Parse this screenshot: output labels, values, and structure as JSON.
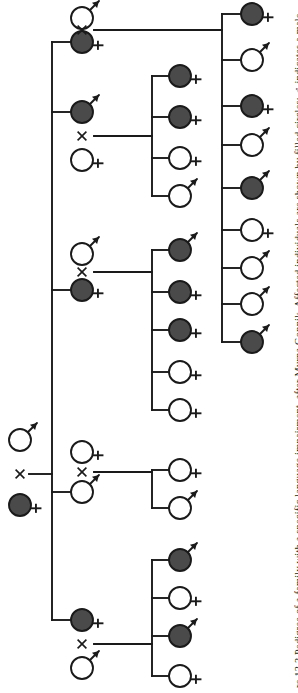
{
  "figure": {
    "caption": "re 13.3 Pedigree of a family with a specific language impairment, after Myrna Gopnik. Affected individuals are shown by filled circles; ♂ indicates a male,",
    "caption_number": "13.3",
    "caption_title": "Pedigree of a family with a specific language impairment",
    "caption_attribution": "after Myrna Gopnik",
    "caption_legend": "Affected individuals are shown by filled circles; ♂ indicates a male,"
  },
  "legend": {
    "affected_label": "affected",
    "unaffected_label": "unaffected",
    "male_symbol": "♂",
    "female_symbol": "♀",
    "mating_symbol": "×",
    "affected_fill": "#4a4a4a",
    "unaffected_fill": "#ffffff",
    "stroke": "#1a1a1a"
  },
  "pedigree": {
    "type": "pedigree",
    "orientation": "left-to-right",
    "generations": 3,
    "total_individuals": 35,
    "founders": {
      "label": "Generation I",
      "members": [
        {
          "id": "I-1",
          "sex": "male",
          "affected": false,
          "x": 20,
          "y": 440
        },
        {
          "id": "I-2",
          "sex": "female",
          "affected": true,
          "x": 20,
          "y": 505
        }
      ],
      "mating_x": 20,
      "mating_y": 474
    },
    "generation_ii": {
      "label": "Generation II",
      "sibship_trunk_x": 52,
      "sibship_top_y": 42,
      "sibship_bottom_y": 620,
      "members": [
        {
          "id": "II-1",
          "sex": "female",
          "affected": true,
          "x": 82,
          "y": 42,
          "spouse_id": "II-1s",
          "spouse_sex": "male",
          "spouse_affected": false,
          "spouse_x": 82,
          "spouse_y": 18,
          "children": 9
        },
        {
          "id": "II-2",
          "sex": "male",
          "affected": true,
          "x": 82,
          "y": 112,
          "spouse_id": "II-2s",
          "spouse_sex": "female",
          "spouse_affected": false,
          "spouse_x": 82,
          "spouse_y": 160,
          "children": 4
        },
        {
          "id": "II-3",
          "sex": "female",
          "affected": true,
          "x": 82,
          "y": 290,
          "spouse_id": "II-3s",
          "spouse_sex": "male",
          "spouse_affected": false,
          "spouse_x": 82,
          "spouse_y": 254,
          "children": 5
        },
        {
          "id": "II-4",
          "sex": "male",
          "affected": false,
          "x": 82,
          "y": 492,
          "spouse_id": "II-4s",
          "spouse_sex": "female",
          "spouse_affected": false,
          "spouse_x": 82,
          "spouse_y": 452,
          "children": 2
        },
        {
          "id": "II-5",
          "sex": "female",
          "affected": true,
          "x": 82,
          "y": 620,
          "spouse_id": "II-5s",
          "spouse_sex": "male",
          "spouse_affected": false,
          "spouse_x": 82,
          "spouse_y": 668,
          "children": 4
        }
      ]
    },
    "generation_iii": {
      "label": "Generation III",
      "sibships": [
        {
          "parent_id": "II-1",
          "trunk_x": 222,
          "child_x": 252,
          "children": [
            {
              "id": "III-1",
              "sex": "female",
              "affected": true,
              "y": 14
            },
            {
              "id": "III-2",
              "sex": "male",
              "affected": false,
              "y": 60
            },
            {
              "id": "III-3",
              "sex": "female",
              "affected": true,
              "y": 106
            },
            {
              "id": "III-4",
              "sex": "male",
              "affected": false,
              "y": 145
            },
            {
              "id": "III-5",
              "sex": "male",
              "affected": true,
              "y": 188
            },
            {
              "id": "III-6",
              "sex": "female",
              "affected": false,
              "y": 230
            },
            {
              "id": "III-7",
              "sex": "male",
              "affected": false,
              "y": 268
            },
            {
              "id": "III-8",
              "sex": "male",
              "affected": false,
              "y": 304
            },
            {
              "id": "III-9",
              "sex": "male",
              "affected": true,
              "y": 342
            }
          ]
        },
        {
          "parent_id": "II-2",
          "trunk_x": 152,
          "child_x": 180,
          "children": [
            {
              "id": "III-10",
              "sex": "female",
              "affected": true,
              "y": 76
            },
            {
              "id": "III-11",
              "sex": "female",
              "affected": true,
              "y": 117
            },
            {
              "id": "III-12",
              "sex": "female",
              "affected": false,
              "y": 158
            },
            {
              "id": "III-13",
              "sex": "male",
              "affected": false,
              "y": 196
            }
          ]
        },
        {
          "parent_id": "II-3",
          "trunk_x": 152,
          "child_x": 180,
          "children": [
            {
              "id": "III-14",
              "sex": "male",
              "affected": true,
              "y": 250
            },
            {
              "id": "III-15",
              "sex": "female",
              "affected": true,
              "y": 292
            },
            {
              "id": "III-16",
              "sex": "female",
              "affected": true,
              "y": 330
            },
            {
              "id": "III-17",
              "sex": "female",
              "affected": false,
              "y": 372
            },
            {
              "id": "III-18",
              "sex": "female",
              "affected": false,
              "y": 410
            }
          ]
        },
        {
          "parent_id": "II-4",
          "trunk_x": 152,
          "child_x": 180,
          "children": [
            {
              "id": "III-19",
              "sex": "female",
              "affected": false,
              "y": 470
            },
            {
              "id": "III-20",
              "sex": "male",
              "affected": false,
              "y": 508
            }
          ]
        },
        {
          "parent_id": "II-5",
          "trunk_x": 152,
          "child_x": 180,
          "children": [
            {
              "id": "III-21",
              "sex": "male",
              "affected": true,
              "y": 560
            },
            {
              "id": "III-22",
              "sex": "female",
              "affected": false,
              "y": 598
            },
            {
              "id": "III-23",
              "sex": "male",
              "affected": true,
              "y": 636
            },
            {
              "id": "III-24",
              "sex": "female",
              "affected": false,
              "y": 676
            }
          ]
        }
      ]
    }
  }
}
